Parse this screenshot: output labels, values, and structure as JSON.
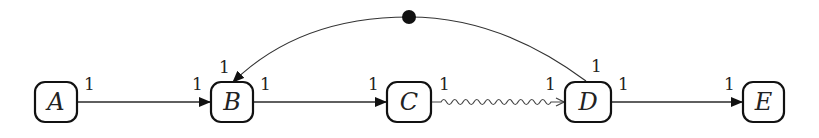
{
  "diagram": {
    "type": "weighted-graph",
    "nodes": [
      {
        "id": "A",
        "label": "A"
      },
      {
        "id": "B",
        "label": "B"
      },
      {
        "id": "C",
        "label": "C"
      },
      {
        "id": "D",
        "label": "D"
      },
      {
        "id": "E",
        "label": "E"
      }
    ],
    "edges": [
      {
        "from": "A",
        "to": "B",
        "style": "straight",
        "arrow": "filled",
        "source_weight": "1",
        "target_weight": "1"
      },
      {
        "from": "B",
        "to": "C",
        "style": "straight",
        "arrow": "filled",
        "source_weight": "1",
        "target_weight": "1"
      },
      {
        "from": "C",
        "to": "D",
        "style": "wavy",
        "arrow": "open",
        "source_weight": "1",
        "target_weight": "1"
      },
      {
        "from": "D",
        "to": "E",
        "style": "straight",
        "arrow": "filled",
        "source_weight": "1",
        "target_weight": "1"
      },
      {
        "from": "D",
        "to": "B",
        "style": "curved-arc",
        "arrow": "filled",
        "midpoint_marker": "filled-dot",
        "source_weight": "1",
        "target_weight": "1"
      }
    ],
    "colors": {
      "stroke": "#111111",
      "background": "#ffffff"
    }
  }
}
